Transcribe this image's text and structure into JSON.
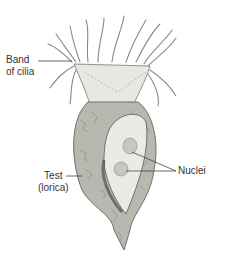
{
  "figure": {
    "labels": {
      "cilia_line1": "Band",
      "cilia_line2": "of cilia",
      "test_line1": "Test",
      "test_line2": "(lorica)",
      "nuclei": "Nuclei"
    },
    "colors": {
      "background": "#ffffff",
      "label_text": "#333333",
      "leader_line": "#444444",
      "collar": "#e8e8e2",
      "lorica": "#b8b8b0",
      "lorica_dark": "#6f6f68",
      "cell_body": "#ebebe6",
      "nucleus": "#c7c7c0"
    }
  }
}
